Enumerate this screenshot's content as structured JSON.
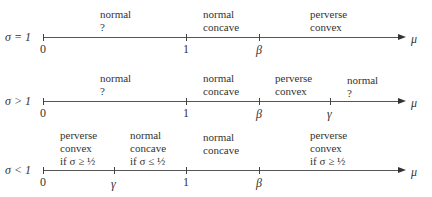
{
  "rows": [
    {
      "label": "σ = 1",
      "ticks": {
        "zero": "0",
        "one": "1",
        "beta": "β"
      },
      "regions": [
        {
          "lines": [
            "normal",
            "?"
          ]
        },
        {
          "lines": [
            "normal",
            "concave"
          ]
        },
        {
          "lines": [
            "perverse",
            "convex"
          ]
        }
      ]
    },
    {
      "label": "σ > 1",
      "ticks": {
        "zero": "0",
        "one": "1",
        "beta": "β",
        "gamma": "γ"
      },
      "regions": [
        {
          "lines": [
            "normal",
            "?"
          ]
        },
        {
          "lines": [
            "normal",
            "concave"
          ]
        },
        {
          "lines": [
            "perverse",
            "convex"
          ]
        },
        {
          "lines": [
            "normal",
            "?"
          ]
        }
      ]
    },
    {
      "label": "σ < 1",
      "ticks": {
        "zero": "0",
        "gamma": "γ",
        "one": "1",
        "beta": "β"
      },
      "regions": [
        {
          "lines": [
            "perverse",
            "convex",
            "if σ ≥ ½"
          ]
        },
        {
          "lines": [
            "normal",
            "concave",
            "if σ ≤ ½"
          ]
        },
        {
          "lines": [
            "normal",
            "concave"
          ]
        },
        {
          "lines": [
            "perverse",
            "convex",
            "if σ ≥ ½"
          ]
        }
      ]
    }
  ],
  "axis_label": "μ"
}
